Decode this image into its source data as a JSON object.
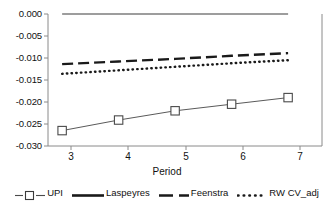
{
  "chart_data": {
    "type": "line",
    "title": "",
    "xlabel": "Period",
    "ylabel": "",
    "x": [
      3,
      4,
      5,
      6,
      7
    ],
    "xticklabels": [
      "3",
      "4",
      "5",
      "6",
      "7"
    ],
    "yticklabels": [
      "0.000",
      "-0.005",
      "-0.010",
      "-0.015",
      "-0.020",
      "-0.025",
      "-0.030"
    ],
    "yticks": [
      0.0,
      -0.005,
      -0.01,
      -0.015,
      -0.02,
      -0.025,
      -0.03
    ],
    "ylim": [
      -0.03,
      0.0
    ],
    "xlim": [
      2.75,
      7.6
    ],
    "grid": false,
    "legend_position": "bottom",
    "series": [
      {
        "name": "UPI",
        "style": "solid-with-square-markers",
        "marker": "square-open",
        "color": "#555555",
        "values": [
          -0.0265,
          -0.0241,
          -0.022,
          -0.0205,
          -0.019
        ]
      },
      {
        "name": "Laspeyres",
        "style": "solid",
        "marker": "none",
        "color": "#777777",
        "values": [
          0.0,
          0.0,
          0.0,
          0.0,
          0.0
        ]
      },
      {
        "name": "Feenstra",
        "style": "dashed",
        "marker": "none",
        "color": "#222222",
        "values": [
          -0.0114,
          -0.0108,
          -0.0102,
          -0.0095,
          -0.0089
        ]
      },
      {
        "name": "RW CV_adj",
        "style": "dotted",
        "marker": "none",
        "color": "#222222",
        "values": [
          -0.0136,
          -0.0128,
          -0.012,
          -0.0112,
          -0.0105
        ]
      }
    ]
  },
  "axes": {
    "x_title": "Period"
  },
  "legend": {
    "items": [
      {
        "label": "UPI"
      },
      {
        "label": "Laspeyres"
      },
      {
        "label": "Feenstra"
      },
      {
        "label": "RW CV_adj"
      }
    ]
  }
}
